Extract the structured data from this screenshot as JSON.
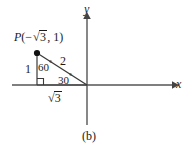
{
  "figure": {
    "caption": "(b)",
    "axes": {
      "x_label": "x",
      "y_label": "y"
    },
    "point": {
      "name": "P",
      "label_prefix": "P(",
      "minus": "−",
      "radical": "√",
      "x_radicand": "3",
      "separator": ", ",
      "y_value": "1",
      "label_suffix": ")"
    },
    "triangle": {
      "vertical_side": "1",
      "hypotenuse": "2",
      "base_radical": "√",
      "base_radicand": "3",
      "angle_at_point": "60",
      "angle_at_origin": "30",
      "degree_symbol": "°"
    },
    "colors": {
      "ink": "#1a1a1a",
      "axis": "#555555",
      "background": "#ffffff"
    }
  }
}
